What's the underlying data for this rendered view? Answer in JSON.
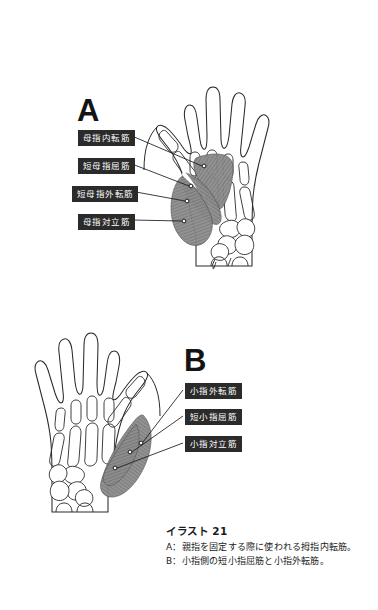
{
  "figure": {
    "panel_a_letter": "A",
    "panel_b_letter": "B"
  },
  "labels_a": [
    {
      "id": "adductor-pollicis",
      "text": "母指内転筋",
      "x": 78,
      "y": 130,
      "w": 52
    },
    {
      "id": "flexor-pollicis-brevis",
      "text": "短母指屈筋",
      "x": 78,
      "y": 158,
      "w": 52
    },
    {
      "id": "abductor-pollicis-brevis",
      "text": "短母指外転筋",
      "x": 72,
      "y": 186,
      "w": 62
    },
    {
      "id": "opponens-pollicis",
      "text": "母指対立筋",
      "x": 78,
      "y": 214,
      "w": 52
    }
  ],
  "labels_b": [
    {
      "id": "abductor-digiti-minimi",
      "text": "小指外転筋",
      "x": 185,
      "y": 383,
      "w": 52
    },
    {
      "id": "flexor-digiti-minimi-brevis",
      "text": "短小指屈筋",
      "x": 185,
      "y": 409,
      "w": 52
    },
    {
      "id": "opponens-digiti-minimi",
      "text": "小指対立筋",
      "x": 185,
      "y": 436,
      "w": 52
    }
  ],
  "caption": {
    "title": "イラスト 21",
    "line_a": "A：親指を固定する際に使われる拇指内転筋。",
    "line_b": "B：小指側の短小指屈筋と小指外転筋。"
  },
  "colors": {
    "background": "#ffffff",
    "outline": "#2a2a2a",
    "muscle_fill": "#8d8d8d",
    "muscle_fiber": "#5d5d5d",
    "label_box": "#2b2b2b",
    "label_text": "#ffffff",
    "leader_line": "#1a1a1a",
    "text": "#1a1a1a"
  }
}
